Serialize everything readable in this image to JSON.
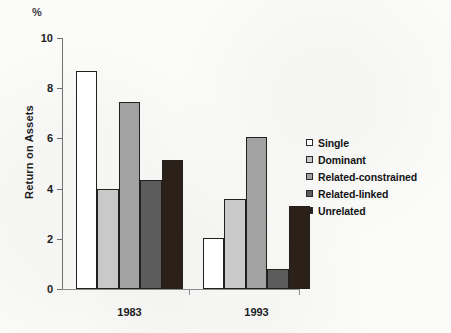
{
  "chart_data": {
    "type": "bar",
    "title": "",
    "subtitle": "",
    "xlabel": "",
    "ylabel": "Return on Assets",
    "unit_label": "%",
    "categories": [
      "1983",
      "1993"
    ],
    "ylim": [
      0,
      10
    ],
    "ytick_labels": [
      "0",
      "2",
      "4",
      "6",
      "8",
      "10"
    ],
    "ytick_values": [
      0,
      2,
      4,
      6,
      8,
      10
    ],
    "grid": false,
    "legend_position": "right",
    "series": [
      {
        "name": "Single",
        "values": [
          8.7,
          2.05
        ],
        "color": "#ffffff"
      },
      {
        "name": "Dominant",
        "values": [
          4.0,
          3.6
        ],
        "color": "#c9c9c9"
      },
      {
        "name": "Related-constrained",
        "values": [
          7.45,
          6.05
        ],
        "color": "#a2a2a2"
      },
      {
        "name": "Related-linked",
        "values": [
          4.35,
          0.8
        ],
        "color": "#5c5c5c"
      },
      {
        "name": "Unrelated",
        "values": [
          5.15,
          3.3
        ],
        "color": "#2b2119"
      }
    ]
  }
}
